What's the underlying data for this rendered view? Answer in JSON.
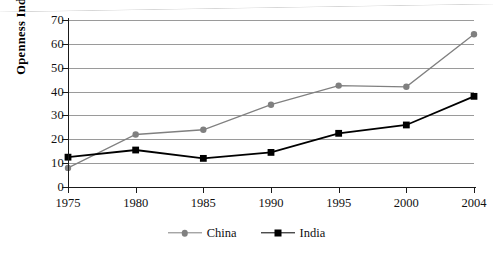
{
  "chart_data": {
    "type": "line",
    "title": "",
    "xlabel": "",
    "ylabel": "Openness Index",
    "x": [
      1975,
      1980,
      1985,
      1990,
      1995,
      2000,
      2004
    ],
    "categories": [
      "1975",
      "1980",
      "1985",
      "1990",
      "1995",
      "2000",
      "2004"
    ],
    "ylim": [
      0,
      70
    ],
    "yticks": [
      0,
      10,
      20,
      30,
      40,
      50,
      60,
      70
    ],
    "ytick_labels": [
      "0",
      "10",
      "20",
      "30",
      "40",
      "50",
      "60",
      "70"
    ],
    "grid": true,
    "grid_axis": "y",
    "legend_position": "bottom",
    "series": [
      {
        "name": "China",
        "color": "#808080",
        "marker": "circle",
        "values": [
          8,
          22,
          24,
          34.5,
          42.5,
          42,
          64
        ]
      },
      {
        "name": "India",
        "color": "#000000",
        "marker": "square",
        "values": [
          12.5,
          15.5,
          12,
          14.5,
          22.5,
          26,
          38
        ]
      }
    ]
  },
  "legend": {
    "items": [
      {
        "label": "China",
        "color": "#808080",
        "marker": "circle"
      },
      {
        "label": "India",
        "color": "#000000",
        "marker": "square"
      }
    ]
  },
  "colors": {
    "china": "#808080",
    "india": "#000000",
    "gridline": "#9a9a9a",
    "axis": "#1a1a1a",
    "background": "#ffffff"
  }
}
